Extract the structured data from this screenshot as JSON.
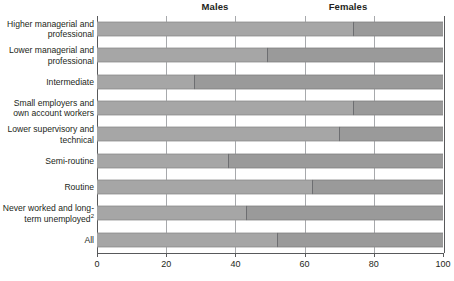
{
  "chart_data": {
    "type": "bar",
    "orientation": "horizontal",
    "stacked": true,
    "percent": true,
    "title": "",
    "xlabel": "",
    "ylabel": "",
    "xlim": [
      0,
      100
    ],
    "xticks": [
      0,
      20,
      40,
      60,
      80,
      100
    ],
    "xtick_labels": [
      "0",
      "20",
      "40",
      "60",
      "80",
      "100"
    ],
    "grid": true,
    "legend_position": "top",
    "legend": [
      "Males",
      "Females"
    ],
    "categories": [
      "Higher managerial and professional",
      "Lower managerial and professional",
      "Intermediate",
      "Small employers and own account workers",
      "Lower supervisory and technical",
      "Semi-routine",
      "Routine",
      "Never worked and long-term unemployed",
      "All"
    ],
    "series": [
      {
        "name": "Males",
        "values": [
          74,
          49,
          28,
          74,
          70,
          38,
          62,
          43,
          52
        ]
      },
      {
        "name": "Females",
        "values": [
          26,
          51,
          72,
          26,
          30,
          62,
          38,
          57,
          48
        ]
      }
    ]
  },
  "header": {
    "males_label": "Males",
    "females_label": "Females"
  },
  "rows": [
    {
      "label_line1": "Higher managerial and",
      "label_line2": "professional",
      "footnote": "",
      "male": 74
    },
    {
      "label_line1": "Lower managerial and",
      "label_line2": "professional",
      "footnote": "",
      "male": 49
    },
    {
      "label_line1": "Intermediate",
      "label_line2": "",
      "footnote": "",
      "male": 28
    },
    {
      "label_line1": "Small employers and",
      "label_line2": "own account workers",
      "footnote": "",
      "male": 74
    },
    {
      "label_line1": "Lower supervisory and",
      "label_line2": "technical",
      "footnote": "",
      "male": 70
    },
    {
      "label_line1": "Semi-routine",
      "label_line2": "",
      "footnote": "",
      "male": 38
    },
    {
      "label_line1": "Routine",
      "label_line2": "",
      "footnote": "",
      "male": 62
    },
    {
      "label_line1": "Never worked and long-",
      "label_line2": "term unemployed",
      "footnote": "2",
      "male": 43
    },
    {
      "label_line1": "All",
      "label_line2": "",
      "footnote": "",
      "male": 52
    }
  ],
  "axis": {
    "ticks": [
      "0",
      "20",
      "40",
      "60",
      "80",
      "100"
    ]
  },
  "colors": {
    "male_segment": "#a6a6a6",
    "female_segment": "#9a9a9a",
    "divider": "#6d6e71",
    "gridline": "#a7a9ac",
    "axis": "#58595b",
    "text": "#231f20"
  }
}
